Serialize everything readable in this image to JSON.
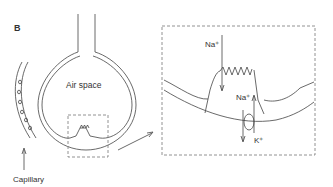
{
  "panel_label": "B",
  "labels": {
    "air_space": "Air space",
    "capillary": "Capillary",
    "na_top": "Na⁺",
    "na_mid": "Na⁺",
    "k": "K⁺"
  },
  "colors": {
    "line": "#444444",
    "dash": "#777777"
  }
}
